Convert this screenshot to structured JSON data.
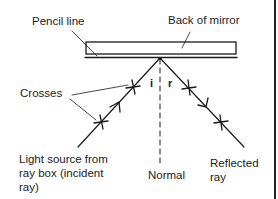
{
  "diagram": {
    "type": "ray-diagram",
    "labels": {
      "pencil_line": "Pencil line",
      "back_of_mirror": "Back of mirror",
      "crosses": "Crosses",
      "incident": "Light source from\nray box (incident\nray)",
      "normal": "Normal",
      "reflected": "Reflected\nray",
      "angle_i": "i",
      "angle_r": "r"
    },
    "colors": {
      "line": "#1a1a1a",
      "background": "#ffffff"
    }
  }
}
